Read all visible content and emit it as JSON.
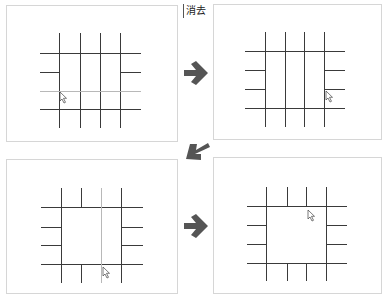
{
  "label": {
    "text": "消去"
  },
  "colors": {
    "line": "#3a3a3a",
    "faint_line": "#b8b8b8",
    "arrow": "#555555",
    "panel_border": "#d6d6d6"
  },
  "panels": [
    {
      "id": 1,
      "box": [
        6,
        5,
        172,
        137
      ],
      "cursor": [
        60,
        92
      ],
      "verticals": [
        [
          59,
          33,
          128
        ],
        [
          80,
          33,
          128
        ],
        [
          100,
          33,
          128
        ],
        [
          120,
          33,
          128
        ]
      ],
      "horizontals": [
        [
          40,
          141,
          53
        ],
        [
          40,
          59,
          72
        ],
        [
          120,
          141,
          72
        ],
        [
          40,
          141,
          109
        ]
      ],
      "faint": [
        [
          40,
          141,
          91
        ]
      ]
    },
    {
      "id": 2,
      "box": [
        213,
        4,
        169,
        136
      ],
      "cursor": [
        326,
        91
      ],
      "verticals": [
        [
          265,
          32,
          127
        ],
        [
          285,
          32,
          127
        ],
        [
          304,
          32,
          127
        ],
        [
          324,
          32,
          127
        ]
      ],
      "horizontals": [
        [
          245,
          345,
          51
        ],
        [
          245,
          265,
          70
        ],
        [
          324,
          345,
          70
        ],
        [
          245,
          265,
          89
        ],
        [
          324,
          345,
          89
        ],
        [
          245,
          345,
          108
        ]
      ],
      "faint": []
    },
    {
      "id": 3,
      "box": [
        6,
        159,
        172,
        135
      ],
      "cursor": [
        103,
        267
      ],
      "verticals": [
        [
          61,
          188,
          283
        ],
        [
          81,
          188,
          207
        ],
        [
          81,
          264,
          283
        ],
        [
          121,
          188,
          283
        ]
      ],
      "horizontals": [
        [
          41,
          143,
          207
        ],
        [
          41,
          61,
          227
        ],
        [
          121,
          143,
          227
        ],
        [
          41,
          61,
          245
        ],
        [
          121,
          143,
          245
        ],
        [
          41,
          143,
          264
        ]
      ],
      "faint": [
        [
          101,
          188,
          283,
          "v"
        ]
      ]
    },
    {
      "id": 4,
      "box": [
        213,
        157,
        169,
        137
      ],
      "cursor": [
        308,
        210
      ],
      "verticals": [
        [
          266,
          187,
          281
        ],
        [
          287,
          187,
          206
        ],
        [
          306,
          187,
          206
        ],
        [
          287,
          263,
          281
        ],
        [
          306,
          263,
          281
        ],
        [
          326,
          187,
          281
        ]
      ],
      "horizontals": [
        [
          247,
          347,
          206
        ],
        [
          247,
          266,
          225
        ],
        [
          326,
          347,
          225
        ],
        [
          247,
          266,
          244
        ],
        [
          326,
          347,
          244
        ],
        [
          247,
          347,
          263
        ]
      ],
      "faint": []
    }
  ],
  "arrows": [
    {
      "direction": "right",
      "x": 181,
      "y": 60
    },
    {
      "direction": "down-left",
      "x": 184,
      "y": 140
    },
    {
      "direction": "right",
      "x": 181,
      "y": 213
    }
  ]
}
